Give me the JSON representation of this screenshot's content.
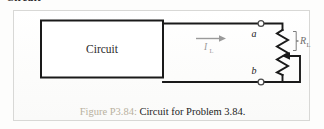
{
  "page": {
    "clipped_heading": "Circuit",
    "background_color": "#fdfdfc"
  },
  "figure": {
    "panel_border_color": "#d8d8d6",
    "caption": {
      "figure_number": "Figure P3.84:",
      "figure_number_color": "#b9b19e",
      "text": "Circuit for Problem 3.84.",
      "text_color": "#1c1c1c",
      "full": "Figure P3.84: Circuit for Problem 3.84."
    },
    "diagram": {
      "type": "electrical-schematic",
      "wire_color": "#1a1a1a",
      "block": {
        "label": "Circuit",
        "shape": "rectangle",
        "fill": "#ffffff",
        "stroke": "#1a1a1a"
      },
      "current_arrow": {
        "label": "I",
        "subscript": "L",
        "direction": "right",
        "color": "#9a9a9a"
      },
      "terminals": [
        {
          "label": "a",
          "position": "top",
          "marker": "open-node"
        },
        {
          "label": "b",
          "position": "bottom",
          "marker": "open-node"
        }
      ],
      "load": {
        "component": "potentiometer",
        "label": "R",
        "subscript": "L",
        "label_color": "#6e6e6e",
        "wiper": "arrow-left",
        "zigzag_peaks": 7
      }
    }
  }
}
